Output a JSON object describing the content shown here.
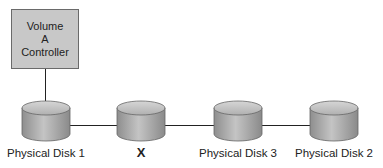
{
  "controller": {
    "lines": [
      "Volume",
      "A",
      "Controller"
    ]
  },
  "disks": [
    {
      "label": "Physical Disk 1",
      "bold": false
    },
    {
      "label": "X",
      "bold": true
    },
    {
      "label": "Physical Disk 3",
      "bold": false
    },
    {
      "label": "Physical Disk 2",
      "bold": false
    }
  ],
  "colors": {
    "controller_fill": "#c8c8c8",
    "disk_fill": "#a8a8a8",
    "line": "#222222"
  }
}
